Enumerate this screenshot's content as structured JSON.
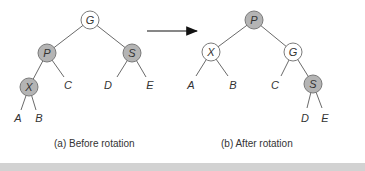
{
  "before": {
    "caption": "(a) Before rotation",
    "nodes": {
      "G": "G",
      "P": "P",
      "S": "S",
      "X": "X"
    },
    "leaves": {
      "A": "A",
      "B": "B",
      "C": "C",
      "D": "D",
      "E": "E"
    },
    "shaded_nodes": [
      "P",
      "S",
      "X"
    ]
  },
  "after": {
    "caption": "(b) After rotation",
    "nodes": {
      "P": "P",
      "X": "X",
      "G": "G",
      "S": "S"
    },
    "leaves": {
      "A": "A",
      "B": "B",
      "C": "C",
      "D": "D",
      "E": "E"
    },
    "shaded_nodes": [
      "P",
      "S"
    ]
  },
  "arrow": {
    "direction": "right"
  },
  "colors": {
    "shaded": "#b4b4b4",
    "edge": "#6a6a6a"
  }
}
